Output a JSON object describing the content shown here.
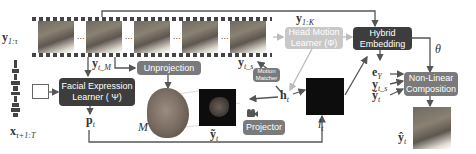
{
  "inputs": {
    "video_label": "y",
    "video_sub": "1:τ",
    "audio_label": "x",
    "audio_sub": "τ+1:T"
  },
  "film": {
    "dots": [
      "...",
      "...",
      "...",
      "..."
    ],
    "sample_label": "y",
    "sample_sub": "t_s",
    "ref_label": "y",
    "ref_sub": "t_M",
    "keyframes_label": "y",
    "keyframes_sub": "1:K"
  },
  "modules": {
    "facial_expression": {
      "line1": "Facial Expression",
      "line2": "Learner ( Ψ)"
    },
    "unprojection": {
      "label": "Unprojection"
    },
    "head_motion": {
      "line1": "Head Motion",
      "line2": "Learner (Φ)"
    },
    "motion_matcher": {
      "line1": "Motion",
      "line2": "Matcher"
    },
    "projector": {
      "label": "Projector"
    },
    "hybrid_embedding": {
      "line1": "Hybrid",
      "line2": "Embedding"
    },
    "nonlinear": {
      "line1": "Non-Linear",
      "line2": "Composition"
    }
  },
  "symbols": {
    "p": "p",
    "p_sub": "t",
    "mesh": "M",
    "ytilde": "ỹ",
    "ytilde_sub": "t",
    "h": "h",
    "h_sub": "t",
    "l": "l",
    "l_sub": "t",
    "theta": "θ",
    "ey": "e",
    "ey_sub": "Y",
    "yts": "y",
    "yts_sub": "t_s",
    "ytilde2": "ỹ",
    "ytilde2_sub": "t",
    "yhat": "ŷ",
    "yhat_sub": "t"
  },
  "colors": {
    "dark_box": "#3d3d3d",
    "mid_box": "#7a7a7a",
    "light_box": "#c8c8c8",
    "arrow": "#555555"
  }
}
